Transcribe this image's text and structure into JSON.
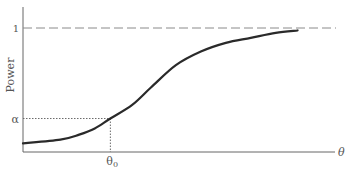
{
  "chart_data": {
    "type": "line",
    "title": "",
    "xlabel": "θ",
    "ylabel": "Power",
    "xlim": [
      0,
      1
    ],
    "ylim": [
      0,
      1
    ],
    "grid": false,
    "legend": "none",
    "y_ticks": [
      {
        "value": 1,
        "label": "1"
      },
      {
        "value": 0.27,
        "label": "α"
      }
    ],
    "x_ticks": [
      {
        "value": 0.28,
        "label": "θ0",
        "main": "θ",
        "sub": "0"
      }
    ],
    "reference_lines": [
      {
        "kind": "horizontal-dashed",
        "y": 1,
        "label": "1"
      },
      {
        "kind": "dotted-guide",
        "x": 0.28,
        "y": 0.27,
        "label": "α at θ0"
      }
    ],
    "series": [
      {
        "name": "power-curve",
        "x": [
          0,
          0.12,
          0.18,
          0.23,
          0.28,
          0.35,
          0.41,
          0.49,
          0.57,
          0.65,
          0.73,
          0.81,
          0.88
        ],
        "y": [
          0.07,
          0.1,
          0.14,
          0.19,
          0.27,
          0.38,
          0.52,
          0.7,
          0.81,
          0.88,
          0.92,
          0.96,
          0.98
        ]
      }
    ],
    "colors": {
      "curve": "#2a2a2a",
      "axis": "#666666",
      "dashed": "#8a8a8a",
      "dotted": "#6a6a6a"
    }
  }
}
